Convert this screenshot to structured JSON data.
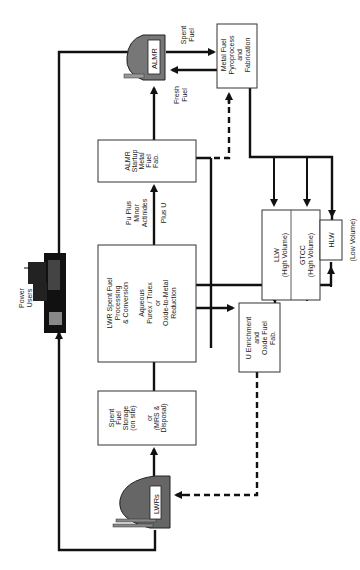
{
  "diagram": {
    "orientation": "rotated 90° clockwise (text reads bottom-to-top)",
    "nodes": {
      "almr": {
        "label": "ALMR",
        "type": "reactor-icon"
      },
      "metal_fuel": {
        "lines": [
          "Metal Fuel",
          "Pyroprocess",
          "and",
          "Fabrication"
        ]
      },
      "almr_startup": {
        "lines": [
          "ALMR",
          "Startup",
          "Metal",
          "Fuel",
          "Fab."
        ]
      },
      "lwr_processing": {
        "lines": [
          "LWR Spent Fuel",
          "Processing",
          "& Conversion",
          "",
          "Aqueous",
          "Purex / Truex",
          "or",
          "Oxide-to-Metal",
          "Reduction"
        ]
      },
      "spent_fuel_storage": {
        "lines": [
          "Spent",
          "Fuel",
          "Storage",
          "(on site)",
          "",
          "or",
          "(MRS &",
          "Disposal)"
        ]
      },
      "lwrs": {
        "label": "LWRs",
        "type": "reactor-icon"
      },
      "u_enrichment": {
        "lines": [
          "U Enrichment",
          "and",
          "Oxide Fuel",
          "Fab."
        ]
      },
      "llw": {
        "lines": [
          "LLW",
          "(High Volume)"
        ]
      },
      "gtcc": {
        "lines": [
          "GTCC",
          "(High Volume)"
        ]
      },
      "hlw": {
        "label": "HLW",
        "note": "(Low  Volume)"
      },
      "power_users": {
        "lines": [
          "Power",
          "Users"
        ],
        "type": "city-icon"
      }
    },
    "edge_labels": {
      "spent_fuel": [
        "Spent",
        "Fuel"
      ],
      "fresh_fuel": [
        "Fresh",
        "Fuel"
      ],
      "pu_plus": [
        "Pu Plus",
        "Minor",
        "Actinides"
      ],
      "plus_u": "Plus U"
    },
    "colors": {
      "line": "#111111",
      "box_border": "#333333",
      "background": "#ffffff"
    }
  }
}
